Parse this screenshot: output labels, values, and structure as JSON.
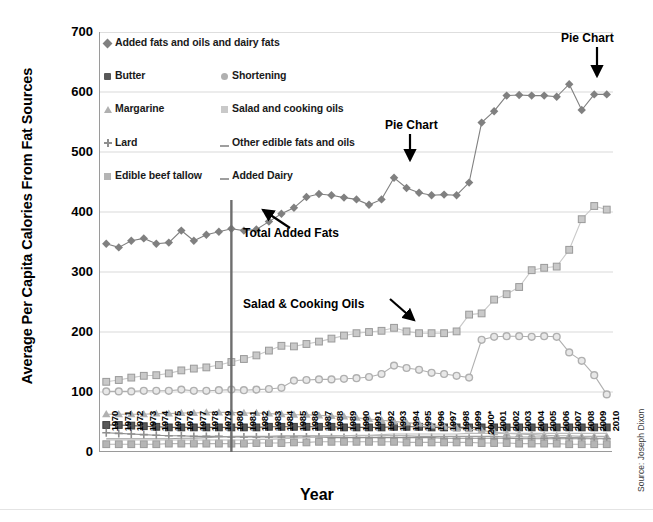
{
  "chart_data": {
    "type": "line",
    "title": "",
    "xlabel": "Year",
    "ylabel": "Average Per Capita Calories From Fat Sources",
    "ylim": [
      0,
      700
    ],
    "yticks": [
      0,
      100,
      200,
      300,
      400,
      500,
      600,
      700
    ],
    "grid": "horizontal",
    "legend_position": "upper-left-inside",
    "categories": [
      "1970",
      "1971",
      "1972",
      "1973",
      "1974",
      "1975",
      "1976",
      "1977",
      "1978",
      "1979",
      "1980",
      "1981",
      "1982",
      "1983",
      "1984",
      "1985",
      "1986",
      "1987",
      "1988",
      "1989",
      "1990",
      "1991",
      "1992",
      "1993",
      "1994",
      "1995",
      "1996",
      "1997",
      "1998",
      "1999",
      "2000*",
      "2001",
      "2002",
      "2003",
      "2004",
      "2005",
      "2006",
      "2007",
      "2008",
      "2009",
      "2010"
    ],
    "series": [
      {
        "name": "Added fats and oils and dairy fats",
        "marker": "diamond",
        "color": "#808080",
        "values": [
          347,
          341,
          352,
          356,
          347,
          349,
          369,
          352,
          362,
          367,
          372,
          369,
          371,
          384,
          397,
          407,
          425,
          430,
          428,
          424,
          421,
          412,
          421,
          457,
          440,
          432,
          428,
          429,
          428,
          449,
          549,
          568,
          594,
          595,
          594,
          594,
          592,
          613,
          570,
          596,
          596
        ]
      },
      {
        "name": "Butter",
        "marker": "square-dark",
        "color": "#595959",
        "values": [
          45,
          45,
          44,
          43,
          42,
          41,
          41,
          41,
          41,
          41,
          41,
          41,
          41,
          42,
          42,
          42,
          42,
          42,
          42,
          41,
          41,
          41,
          41,
          42,
          42,
          42,
          41,
          41,
          41,
          41,
          41,
          41,
          41,
          41,
          41,
          41,
          41,
          41,
          41,
          41,
          41
        ]
      },
      {
        "name": "Margarine",
        "marker": "star",
        "color": "#b0b0b0",
        "values": [
          63,
          63,
          63,
          63,
          64,
          64,
          65,
          65,
          66,
          66,
          66,
          65,
          65,
          64,
          63,
          62,
          62,
          61,
          60,
          59,
          57,
          55,
          53,
          51,
          49,
          47,
          44,
          42,
          40,
          38,
          36,
          33,
          31,
          30,
          29,
          28,
          27,
          27,
          26,
          26,
          26
        ]
      },
      {
        "name": "Lard",
        "marker": "plus",
        "color": "#8f8f8f",
        "values": [
          32,
          31,
          30,
          29,
          28,
          27,
          27,
          26,
          26,
          26,
          25,
          25,
          25,
          25,
          25,
          25,
          25,
          25,
          24,
          24,
          24,
          24,
          24,
          24,
          24,
          24,
          24,
          23,
          23,
          23,
          23,
          23,
          23,
          22,
          22,
          22,
          22,
          22,
          22,
          22,
          22
        ]
      },
      {
        "name": "Edible beef tallow",
        "marker": "square-light",
        "color": "#b5b5b5",
        "values": [
          13,
          13,
          13,
          13,
          13,
          14,
          14,
          14,
          14,
          14,
          14,
          14,
          15,
          15,
          15,
          16,
          16,
          17,
          17,
          17,
          17,
          17,
          17,
          17,
          16,
          16,
          16,
          16,
          16,
          16,
          15,
          15,
          15,
          14,
          14,
          14,
          14,
          13,
          13,
          13,
          13
        ]
      },
      {
        "name": "Shortening",
        "marker": "circle",
        "color": "#b0b0b0",
        "values": [
          101,
          101,
          101,
          102,
          102,
          102,
          104,
          102,
          102,
          103,
          104,
          103,
          104,
          105,
          107,
          119,
          120,
          121,
          121,
          122,
          123,
          125,
          130,
          144,
          140,
          137,
          132,
          130,
          127,
          124,
          187,
          192,
          193,
          193,
          192,
          193,
          192,
          166,
          152,
          128,
          96
        ]
      },
      {
        "name": "Salad and cooking oils",
        "marker": "square-pale",
        "color": "#c9c9c9",
        "values": [
          117,
          120,
          124,
          127,
          128,
          131,
          136,
          139,
          141,
          145,
          150,
          155,
          161,
          169,
          177,
          176,
          180,
          184,
          189,
          194,
          198,
          200,
          202,
          207,
          201,
          198,
          198,
          198,
          201,
          229,
          231,
          254,
          263,
          275,
          303,
          307,
          309,
          337,
          388,
          410,
          404
        ]
      },
      {
        "name": "Other edible fats and oils",
        "marker": "line",
        "color": "#9e9e9e",
        "values": [
          22,
          22,
          22,
          22,
          22,
          22,
          23,
          23,
          24,
          25,
          26,
          26,
          26,
          26,
          27,
          27,
          27,
          27,
          27,
          27,
          27,
          27,
          27,
          27,
          27,
          26,
          26,
          26,
          26,
          26,
          26,
          26,
          25,
          25,
          25,
          25,
          24,
          24,
          24,
          23,
          23
        ]
      },
      {
        "name": "Added Dairy",
        "marker": "line",
        "color": "#bcbcbc",
        "values": [
          20,
          20,
          20,
          20,
          20,
          20,
          20,
          20,
          20,
          20,
          20,
          20,
          21,
          21,
          22,
          23,
          24,
          25,
          26,
          27,
          28,
          28,
          29,
          30,
          30,
          30,
          30,
          30,
          30,
          31,
          31,
          31,
          31,
          31,
          31,
          31,
          31,
          31,
          31,
          31,
          31
        ]
      }
    ],
    "reference_line": {
      "at": "1980",
      "color": "#6e6e6e"
    },
    "annotations": [
      {
        "id": "pie-chart-1",
        "text": "Pie Chart",
        "points_to": "1993 peak of Added fats and oils and dairy fats"
      },
      {
        "id": "pie-chart-2",
        "text": "Pie Chart",
        "points_to": "2009 of Added fats and oils and dairy fats"
      },
      {
        "id": "total-added-fats",
        "text": "Total Added Fats",
        "points_to": "Added fats and oils and dairy fats series"
      },
      {
        "id": "salad-cooking-oils",
        "text": "Salad & Cooking Oils",
        "points_to": "Salad and cooking oils series"
      }
    ]
  },
  "legend": {
    "items": [
      {
        "label": "Added fats and oils and dairy fats",
        "marker": "diamond"
      },
      {
        "label": "Butter",
        "marker": "square-dark"
      },
      {
        "label": "Shortening",
        "marker": "circle"
      },
      {
        "label": "Margarine",
        "marker": "star"
      },
      {
        "label": "Salad and cooking oils",
        "marker": "square-pale"
      },
      {
        "label": "Lard",
        "marker": "plus"
      },
      {
        "label": "Other edible fats and oils",
        "marker": "dash"
      },
      {
        "label": "Edible beef tallow",
        "marker": "square-light"
      },
      {
        "label": "Added Dairy",
        "marker": "dash"
      }
    ]
  },
  "source_note": "Source: Joseph Dixon",
  "colors": {
    "axis": "#9a9a9a",
    "grid": "#d9d9d9",
    "reference_line": "#6e6e6e",
    "text": "#000000"
  }
}
